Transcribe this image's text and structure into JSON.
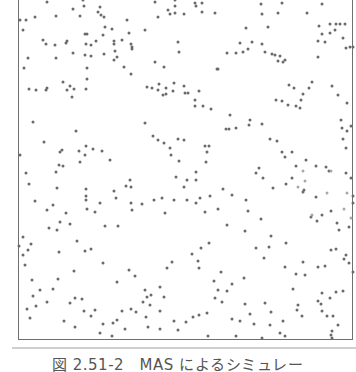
{
  "figure": {
    "caption": "図 2.51-2　MAS によるシミュレー",
    "frame_color": "#6f6f6f",
    "dot_color": "#6a6a6a",
    "rule_color": "#cfcfcf"
  },
  "chart_data": {
    "type": "scatter",
    "title": "図 2.51-2　MAS によるシミュレー",
    "xlabel": "",
    "ylabel": "",
    "grid": false,
    "legend": null,
    "note": "Agent positions in a multi-agent simulation; no axis ticks shown. Coordinates in image pixels (x from plot left edge 18px, y from top).",
    "points": [
      [
        47,
        2
      ],
      [
        84,
        6
      ],
      [
        83,
        0
      ],
      [
        101,
        15
      ],
      [
        80,
        16
      ],
      [
        98,
        12
      ],
      [
        56,
        16
      ],
      [
        26,
        20
      ],
      [
        73,
        9
      ],
      [
        100,
        7
      ],
      [
        104,
        17
      ],
      [
        155,
        2
      ],
      [
        175,
        0
      ],
      [
        175,
        6
      ],
      [
        195,
        3
      ],
      [
        168,
        10
      ],
      [
        202,
        3
      ],
      [
        175,
        13
      ],
      [
        196,
        6
      ],
      [
        170,
        14
      ],
      [
        158,
        17
      ],
      [
        184,
        14
      ],
      [
        202,
        12
      ],
      [
        215,
        13
      ],
      [
        262,
        14
      ],
      [
        278,
        13
      ],
      [
        282,
        3
      ],
      [
        261,
        4
      ],
      [
        307,
        13
      ],
      [
        322,
        4
      ],
      [
        330,
        24
      ],
      [
        336,
        24
      ],
      [
        340,
        24
      ],
      [
        345,
        24
      ],
      [
        20,
        20
      ],
      [
        23,
        30
      ],
      [
        35,
        17
      ],
      [
        43,
        40
      ],
      [
        46,
        44
      ],
      [
        56,
        58
      ],
      [
        66,
        43
      ],
      [
        67,
        41
      ],
      [
        73,
        53
      ],
      [
        85,
        55
      ],
      [
        86,
        44
      ],
      [
        55,
        45
      ],
      [
        28,
        58
      ],
      [
        24,
        68
      ],
      [
        29,
        89
      ],
      [
        36,
        90
      ],
      [
        46,
        90
      ],
      [
        47,
        88
      ],
      [
        63,
        82
      ],
      [
        70,
        86
      ],
      [
        67,
        90
      ],
      [
        74,
        89
      ],
      [
        86,
        89
      ],
      [
        72,
        97
      ],
      [
        87,
        79
      ],
      [
        87,
        68
      ],
      [
        87,
        34
      ],
      [
        85,
        34
      ],
      [
        91,
        45
      ],
      [
        96,
        41
      ],
      [
        103,
        35
      ],
      [
        112,
        29
      ],
      [
        114,
        41
      ],
      [
        114,
        44
      ],
      [
        91,
        56
      ],
      [
        105,
        27
      ],
      [
        117,
        57
      ],
      [
        122,
        40
      ],
      [
        104,
        54
      ],
      [
        115,
        51
      ],
      [
        114,
        60
      ],
      [
        124,
        67
      ],
      [
        127,
        20
      ],
      [
        129,
        33
      ],
      [
        132,
        49
      ],
      [
        131,
        44
      ],
      [
        132,
        47
      ],
      [
        131,
        74
      ],
      [
        145,
        30
      ],
      [
        155,
        62
      ],
      [
        159,
        84
      ],
      [
        164,
        67
      ],
      [
        178,
        42
      ],
      [
        179,
        52
      ],
      [
        184,
        86
      ],
      [
        188,
        93
      ],
      [
        195,
        100
      ],
      [
        195,
        106
      ],
      [
        147,
        87
      ],
      [
        152,
        88
      ],
      [
        158,
        90
      ],
      [
        163,
        95
      ],
      [
        166,
        88
      ],
      [
        166,
        94
      ],
      [
        173,
        91
      ],
      [
        174,
        83
      ],
      [
        185,
        93
      ],
      [
        199,
        91
      ],
      [
        203,
        106
      ],
      [
        211,
        109
      ],
      [
        217,
        69
      ],
      [
        218,
        69
      ],
      [
        227,
        53
      ],
      [
        236,
        53
      ],
      [
        240,
        43
      ],
      [
        243,
        52
      ],
      [
        246,
        28
      ],
      [
        248,
        49
      ],
      [
        252,
        42
      ],
      [
        262,
        44
      ],
      [
        265,
        52
      ],
      [
        268,
        27
      ],
      [
        272,
        54
      ],
      [
        275,
        55
      ],
      [
        278,
        61
      ],
      [
        280,
        56
      ],
      [
        283,
        62
      ],
      [
        285,
        60
      ],
      [
        289,
        85
      ],
      [
        294,
        88
      ],
      [
        296,
        106
      ],
      [
        301,
        100
      ],
      [
        303,
        94
      ],
      [
        309,
        88
      ],
      [
        312,
        82
      ],
      [
        319,
        26
      ],
      [
        322,
        34
      ],
      [
        325,
        42
      ],
      [
        330,
        33
      ],
      [
        335,
        30
      ],
      [
        343,
        38
      ],
      [
        346,
        48
      ],
      [
        350,
        47
      ],
      [
        353,
        47
      ],
      [
        318,
        41
      ],
      [
        318,
        57
      ],
      [
        276,
        100
      ],
      [
        282,
        101
      ],
      [
        288,
        105
      ],
      [
        300,
        108
      ],
      [
        332,
        86
      ],
      [
        338,
        95
      ],
      [
        347,
        103
      ],
      [
        33,
        122
      ],
      [
        44,
        142
      ],
      [
        62,
        150
      ],
      [
        60,
        152
      ],
      [
        76,
        131
      ],
      [
        79,
        151
      ],
      [
        85,
        155
      ],
      [
        93,
        149
      ],
      [
        80,
        162
      ],
      [
        63,
        166
      ],
      [
        56,
        172
      ],
      [
        59,
        165
      ],
      [
        86,
        146
      ],
      [
        102,
        151
      ],
      [
        110,
        160
      ],
      [
        145,
        123
      ],
      [
        153,
        136
      ],
      [
        158,
        140
      ],
      [
        164,
        143
      ],
      [
        170,
        148
      ],
      [
        171,
        155
      ],
      [
        179,
        161
      ],
      [
        178,
        139
      ],
      [
        184,
        140
      ],
      [
        205,
        146
      ],
      [
        209,
        146
      ],
      [
        207,
        152
      ],
      [
        206,
        162
      ],
      [
        196,
        172
      ],
      [
        196,
        180
      ],
      [
        187,
        180
      ],
      [
        200,
        198
      ],
      [
        210,
        196
      ],
      [
        223,
        189
      ],
      [
        226,
        129
      ],
      [
        229,
        129
      ],
      [
        230,
        115
      ],
      [
        236,
        128
      ],
      [
        249,
        125
      ],
      [
        250,
        120
      ],
      [
        262,
        124
      ],
      [
        270,
        139
      ],
      [
        277,
        141
      ],
      [
        282,
        152
      ],
      [
        285,
        157
      ],
      [
        292,
        152
      ],
      [
        306,
        160
      ],
      [
        296,
        166
      ],
      [
        305,
        181
      ],
      [
        304,
        190
      ],
      [
        326,
        167
      ],
      [
        341,
        120
      ],
      [
        342,
        128
      ],
      [
        347,
        131
      ],
      [
        351,
        126
      ],
      [
        263,
        178
      ],
      [
        259,
        168
      ],
      [
        303,
        171
      ],
      [
        316,
        166
      ],
      [
        329,
        171
      ],
      [
        331,
        171
      ],
      [
        346,
        173
      ],
      [
        351,
        178
      ],
      [
        343,
        139
      ],
      [
        346,
        148
      ],
      [
        20,
        155
      ],
      [
        26,
        173
      ],
      [
        29,
        184
      ],
      [
        35,
        201
      ],
      [
        47,
        210
      ],
      [
        53,
        205
      ],
      [
        57,
        188
      ],
      [
        66,
        213
      ],
      [
        70,
        224
      ],
      [
        60,
        222
      ],
      [
        86,
        189
      ],
      [
        86,
        196
      ],
      [
        86,
        200
      ],
      [
        87,
        209
      ],
      [
        95,
        212
      ],
      [
        100,
        203
      ],
      [
        105,
        226
      ],
      [
        114,
        191
      ],
      [
        116,
        198
      ],
      [
        118,
        226
      ],
      [
        126,
        186
      ],
      [
        131,
        203
      ],
      [
        132,
        210
      ],
      [
        130,
        180
      ],
      [
        131,
        187
      ],
      [
        142,
        204
      ],
      [
        154,
        200
      ],
      [
        162,
        198
      ],
      [
        165,
        213
      ],
      [
        176,
        177
      ],
      [
        174,
        200
      ],
      [
        184,
        187
      ],
      [
        187,
        200
      ],
      [
        196,
        203
      ],
      [
        205,
        212
      ],
      [
        218,
        209
      ],
      [
        227,
        225
      ],
      [
        232,
        195
      ],
      [
        246,
        200
      ],
      [
        248,
        211
      ],
      [
        245,
        231
      ],
      [
        256,
        173
      ],
      [
        261,
        219
      ],
      [
        273,
        188
      ],
      [
        286,
        184
      ],
      [
        292,
        178
      ],
      [
        298,
        187
      ],
      [
        303,
        192
      ],
      [
        311,
        217
      ],
      [
        312,
        215
      ],
      [
        316,
        197
      ],
      [
        317,
        221
      ],
      [
        327,
        193
      ],
      [
        331,
        211
      ],
      [
        337,
        223
      ],
      [
        347,
        193
      ],
      [
        353,
        196
      ],
      [
        353,
        203
      ],
      [
        351,
        218
      ],
      [
        349,
        227
      ],
      [
        339,
        230
      ],
      [
        344,
        209
      ],
      [
        322,
        215
      ],
      [
        19,
        246
      ],
      [
        23,
        237
      ],
      [
        31,
        244
      ],
      [
        28,
        250
      ],
      [
        49,
        228
      ],
      [
        57,
        230
      ],
      [
        59,
        252
      ],
      [
        77,
        241
      ],
      [
        85,
        251
      ],
      [
        91,
        249
      ],
      [
        103,
        263
      ],
      [
        117,
        282
      ],
      [
        129,
        270
      ],
      [
        135,
        276
      ],
      [
        145,
        290
      ],
      [
        151,
        295
      ],
      [
        160,
        287
      ],
      [
        167,
        268
      ],
      [
        172,
        262
      ],
      [
        192,
        254
      ],
      [
        198,
        261
      ],
      [
        199,
        268
      ],
      [
        201,
        248
      ],
      [
        209,
        243
      ],
      [
        214,
        281
      ],
      [
        221,
        272
      ],
      [
        222,
        302
      ],
      [
        218,
        290
      ],
      [
        227,
        291
      ],
      [
        232,
        284
      ],
      [
        244,
        278
      ],
      [
        256,
        248
      ],
      [
        264,
        258
      ],
      [
        269,
        247
      ],
      [
        271,
        236
      ],
      [
        285,
        267
      ],
      [
        286,
        243
      ],
      [
        296,
        274
      ],
      [
        303,
        262
      ],
      [
        305,
        275
      ],
      [
        318,
        267
      ],
      [
        325,
        266
      ],
      [
        331,
        250
      ],
      [
        336,
        249
      ],
      [
        344,
        259
      ],
      [
        346,
        255
      ],
      [
        349,
        263
      ],
      [
        353,
        272
      ],
      [
        336,
        292
      ],
      [
        330,
        298
      ],
      [
        343,
        291
      ],
      [
        23,
        255
      ],
      [
        25,
        265
      ],
      [
        32,
        280
      ],
      [
        40,
        290
      ],
      [
        53,
        289
      ],
      [
        58,
        279
      ],
      [
        70,
        303
      ],
      [
        75,
        298
      ],
      [
        74,
        271
      ],
      [
        82,
        299
      ],
      [
        84,
        311
      ],
      [
        91,
        316
      ],
      [
        103,
        324
      ],
      [
        113,
        323
      ],
      [
        122,
        311
      ],
      [
        131,
        309
      ],
      [
        143,
        302
      ],
      [
        147,
        297
      ],
      [
        150,
        305
      ],
      [
        160,
        311
      ],
      [
        164,
        297
      ],
      [
        174,
        321
      ],
      [
        199,
        315
      ],
      [
        207,
        313
      ],
      [
        232,
        319
      ],
      [
        245,
        304
      ],
      [
        254,
        324
      ],
      [
        265,
        303
      ],
      [
        271,
        312
      ],
      [
        283,
        321
      ],
      [
        285,
        336
      ],
      [
        293,
        289
      ],
      [
        298,
        305
      ],
      [
        297,
        310
      ],
      [
        302,
        316
      ],
      [
        321,
        304
      ],
      [
        322,
        293
      ],
      [
        327,
        316
      ],
      [
        333,
        316
      ],
      [
        338,
        325
      ],
      [
        331,
        335
      ],
      [
        112,
        336
      ],
      [
        208,
        336
      ],
      [
        236,
        336
      ],
      [
        262,
        338
      ],
      [
        332,
        331
      ],
      [
        332,
        338
      ],
      [
        280,
        333
      ],
      [
        322,
        311
      ],
      [
        318,
        301
      ],
      [
        215,
        298
      ],
      [
        30,
        318
      ],
      [
        27,
        309
      ],
      [
        36,
        306
      ],
      [
        47,
        302
      ],
      [
        33,
        296
      ],
      [
        64,
        321
      ],
      [
        75,
        327
      ],
      [
        95,
        310
      ],
      [
        100,
        333
      ],
      [
        117,
        320
      ],
      [
        125,
        329
      ],
      [
        136,
        312
      ],
      [
        146,
        317
      ],
      [
        148,
        327
      ],
      [
        160,
        329
      ],
      [
        178,
        330
      ],
      [
        186,
        322
      ],
      [
        193,
        317
      ],
      [
        240,
        321
      ],
      [
        250,
        314
      ],
      [
        270,
        325
      ]
    ]
  }
}
